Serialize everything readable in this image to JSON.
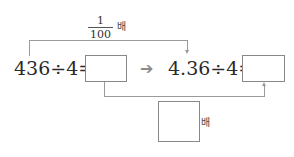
{
  "problem": {
    "left_equation": "436÷4=",
    "right_equation": "4.36÷4=",
    "top_factor": {
      "numerator": "1",
      "denominator": "100",
      "unit": "배"
    },
    "bottom_factor": {
      "unit": "배"
    },
    "arrow": "➔"
  }
}
